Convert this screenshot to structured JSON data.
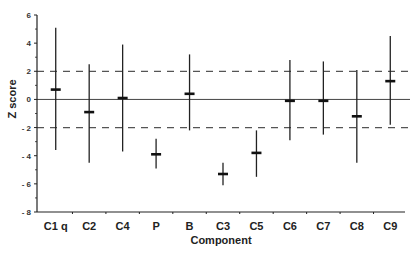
{
  "chart_data": {
    "type": "scatter",
    "subtype": "error-bar",
    "title": "",
    "xlabel": "Component",
    "ylabel": "Z score",
    "ylim": [
      -8,
      6
    ],
    "yticks": [
      6,
      4,
      2,
      0,
      -2,
      -4,
      -6,
      -8
    ],
    "ytick_labels": [
      "6",
      "4",
      "2",
      "0",
      "- 2",
      "- 4",
      "- 6",
      "- 8"
    ],
    "grid": false,
    "reference_lines": [
      {
        "y": 0,
        "style": "solid"
      },
      {
        "y": 2,
        "style": "dashed"
      },
      {
        "y": -2,
        "style": "dashed"
      }
    ],
    "categories": [
      "C1 q",
      "C2",
      "C4",
      "P",
      "B",
      "C3",
      "C5",
      "C6",
      "C7",
      "C8",
      "C9"
    ],
    "series": [
      {
        "name": "mean",
        "values": [
          0.7,
          -0.9,
          0.1,
          -3.9,
          0.4,
          -5.3,
          -3.8,
          -0.1,
          -0.1,
          -1.2,
          1.3
        ]
      },
      {
        "name": "upper",
        "values": [
          5.1,
          2.5,
          3.9,
          -2.8,
          3.2,
          -4.5,
          -2.2,
          2.8,
          2.7,
          2.1,
          4.5
        ]
      },
      {
        "name": "lower",
        "values": [
          -3.6,
          -4.5,
          -3.7,
          -4.9,
          -2.2,
          -6.1,
          -5.5,
          -2.9,
          -2.5,
          -4.5,
          -1.8
        ]
      }
    ],
    "legend": null
  }
}
